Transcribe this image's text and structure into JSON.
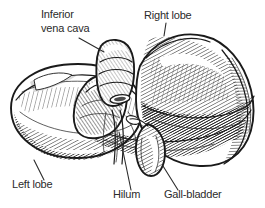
{
  "figure": {
    "background_color": "#ffffff",
    "ink_color": "#1a1a1a",
    "label_color": "#2b2b2b",
    "width": 265,
    "height": 208
  },
  "labels": [
    {
      "id": "inferior-vena-cava",
      "line1": "Inferior",
      "line2": "vena cava",
      "x": 41,
      "y": 18,
      "anchor": "start"
    },
    {
      "id": "right-lobe",
      "line1": "Right lobe",
      "x": 144,
      "y": 19,
      "anchor": "start"
    },
    {
      "id": "left-lobe",
      "line1": "Left lobe",
      "x": 12,
      "y": 188,
      "anchor": "start"
    },
    {
      "id": "hilum",
      "line1": "Hilum",
      "x": 113,
      "y": 198,
      "anchor": "start"
    },
    {
      "id": "gall-bladder",
      "line1": "Gall-bladder",
      "x": 164,
      "y": 198,
      "anchor": "start"
    }
  ],
  "structures": [
    {
      "id": "right-lobe-mass",
      "name": "Right lobe"
    },
    {
      "id": "left-lobe-mass",
      "name": "Left lobe"
    },
    {
      "id": "inferior-vena-cava-vessel",
      "name": "Inferior vena cava"
    },
    {
      "id": "hilum-region",
      "name": "Hilum"
    },
    {
      "id": "gall-bladder-sac",
      "name": "Gall-bladder"
    },
    {
      "id": "caudate-lobe",
      "name": "Caudate lobe"
    }
  ]
}
